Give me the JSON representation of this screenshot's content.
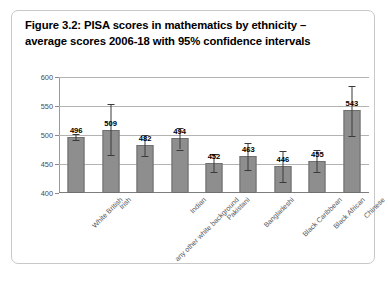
{
  "figure": {
    "title_line1": "Figure 3.2: PISA scores in mathematics by ethnicity –",
    "title_line2": "average scores 2006-18 with 95% confidence intervals"
  },
  "chart_data": {
    "type": "bar",
    "title": "Figure 3.2: PISA scores in mathematics by ethnicity – average scores 2006-18 with 95% confidence intervals",
    "xlabel": "",
    "ylabel": "",
    "ylim": [
      400,
      600
    ],
    "yticks": [
      400,
      450,
      500,
      550,
      600
    ],
    "ytick_labels": [
      "400",
      "450",
      "500",
      "550",
      "600"
    ],
    "grid": true,
    "legend": null,
    "categories": [
      "White British",
      "Irish",
      "any other white background",
      "Indian",
      "Pakistani",
      "Bangladeshi",
      "Black Caribbean",
      "Black African",
      "Chinese"
    ],
    "values": [
      496,
      509,
      482,
      494,
      452,
      463,
      446,
      455,
      543
    ],
    "value_labels": [
      "496",
      "509",
      "482",
      "494",
      "452",
      "463",
      "446",
      "455",
      "543"
    ],
    "error_low": [
      491,
      466,
      464,
      475,
      437,
      440,
      419,
      436,
      499
    ],
    "error_high": [
      501,
      553,
      500,
      512,
      467,
      487,
      473,
      474,
      585
    ],
    "bar_color": "#8e8e8e",
    "error_bar_color": "#3a3a3a",
    "gridline_color": "#b3b3b3"
  }
}
